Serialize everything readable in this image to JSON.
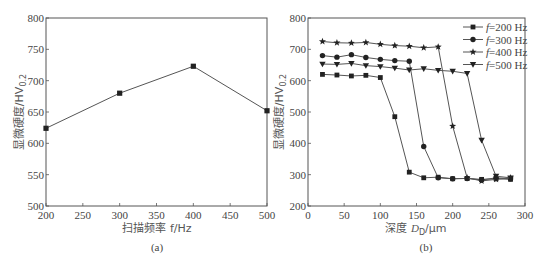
{
  "chart_data": [
    {
      "panel": "(a)",
      "type": "line",
      "title": "",
      "xlabel": "扫描频率 f/Hz",
      "ylabel": "显微硬度/HV0.2",
      "xlim": [
        200,
        500
      ],
      "ylim": [
        500,
        800
      ],
      "xticks": [
        200,
        250,
        300,
        350,
        400,
        450,
        500
      ],
      "yticks": [
        500,
        550,
        600,
        650,
        700,
        750,
        800
      ],
      "grid": false,
      "x": [
        200,
        300,
        400,
        500
      ],
      "series": [
        {
          "name": "hardness",
          "marker": "square",
          "values": [
            624,
            680,
            723,
            652
          ]
        }
      ]
    },
    {
      "panel": "(b)",
      "type": "line",
      "title": "",
      "xlabel": "深度 D_D/μm",
      "ylabel": "显微硬度/HV0.2",
      "xlim": [
        0,
        300
      ],
      "ylim": [
        200,
        800
      ],
      "xticks": [
        0,
        50,
        100,
        150,
        200,
        250,
        300
      ],
      "yticks": [
        200,
        300,
        400,
        500,
        600,
        700,
        800
      ],
      "grid": false,
      "legend_position": "upper right",
      "x": [
        20,
        40,
        60,
        80,
        100,
        120,
        140,
        160,
        180,
        200,
        220,
        240,
        260,
        280
      ],
      "series": [
        {
          "name": "f=200 Hz",
          "marker": "square",
          "values": [
            620,
            618,
            615,
            617,
            610,
            485,
            308,
            290,
            292,
            287,
            288,
            285,
            287,
            285
          ]
        },
        {
          "name": "f=300 Hz",
          "marker": "circle",
          "values": [
            680,
            675,
            683,
            674,
            668,
            664,
            662,
            390,
            290,
            287,
            288,
            283,
            290,
            287
          ]
        },
        {
          "name": "f=400 Hz",
          "marker": "star",
          "values": [
            725,
            721,
            720,
            722,
            716,
            712,
            710,
            705,
            708,
            455,
            290,
            280,
            285,
            290
          ]
        },
        {
          "name": "f=500 Hz",
          "marker": "triangle-down",
          "values": [
            653,
            652,
            655,
            648,
            645,
            640,
            634,
            638,
            633,
            630,
            623,
            410,
            295,
            290
          ]
        }
      ]
    }
  ],
  "labels": {
    "a": {
      "xlabel": "扫描频率 f/Hz",
      "ylabel": "显微硬度/HV",
      "ylabel_sub": "0.2",
      "panel": "(a)"
    },
    "b": {
      "xlabel_pre": "深度 ",
      "xlabel_var": "D",
      "xlabel_sub": "D",
      "xlabel_post": "/μm",
      "ylabel": "显微硬度/HV",
      "ylabel_sub": "0.2",
      "panel": "(b)"
    }
  },
  "colors": {
    "line": "#555555",
    "marker": "#222222",
    "axis": "#555555"
  }
}
